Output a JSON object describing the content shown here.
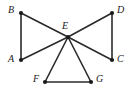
{
  "figure": {
    "kind": "undirected-graph-diagram",
    "width": 136,
    "height": 95,
    "background_color": "#ffffff",
    "edge_color": "#2b2b2b",
    "vertex_color": "#1a1a1a",
    "label_color": "#1a1a1a",
    "edge_width": 1.6,
    "vertex_radius": 2.1
  },
  "vertices": [
    {
      "id": "A",
      "label": "A",
      "x": 21,
      "y": 60,
      "label_x": 8,
      "label_y": 54
    },
    {
      "id": "B",
      "label": "B",
      "x": 21,
      "y": 13,
      "label_x": 8,
      "label_y": 5
    },
    {
      "id": "C",
      "label": "C",
      "x": 112,
      "y": 60,
      "label_x": 117,
      "label_y": 54
    },
    {
      "id": "D",
      "label": "D",
      "x": 112,
      "y": 13,
      "label_x": 117,
      "label_y": 5
    },
    {
      "id": "E",
      "label": "E",
      "x": 68,
      "y": 37,
      "label_x": 62,
      "label_y": 21
    },
    {
      "id": "F",
      "label": "F",
      "x": 45,
      "y": 82,
      "label_x": 33,
      "label_y": 74
    },
    {
      "id": "G",
      "label": "G",
      "x": 91,
      "y": 82,
      "label_x": 96,
      "label_y": 74
    }
  ],
  "edges": [
    {
      "from": "A",
      "to": "B",
      "x1": 21,
      "y1": 60,
      "x2": 21,
      "y2": 13
    },
    {
      "from": "B",
      "to": "E",
      "x1": 21,
      "y1": 13,
      "x2": 68,
      "y2": 37
    },
    {
      "from": "A",
      "to": "E",
      "x1": 21,
      "y1": 60,
      "x2": 68,
      "y2": 37
    },
    {
      "from": "C",
      "to": "D",
      "x1": 112,
      "y1": 60,
      "x2": 112,
      "y2": 13
    },
    {
      "from": "E",
      "to": "D",
      "x1": 68,
      "y1": 37,
      "x2": 112,
      "y2": 13
    },
    {
      "from": "E",
      "to": "C",
      "x1": 68,
      "y1": 37,
      "x2": 112,
      "y2": 60
    },
    {
      "from": "E",
      "to": "F",
      "x1": 68,
      "y1": 37,
      "x2": 45,
      "y2": 82
    },
    {
      "from": "E",
      "to": "G",
      "x1": 68,
      "y1": 37,
      "x2": 91,
      "y2": 82
    },
    {
      "from": "F",
      "to": "G",
      "x1": 45,
      "y1": 82,
      "x2": 91,
      "y2": 82
    }
  ]
}
